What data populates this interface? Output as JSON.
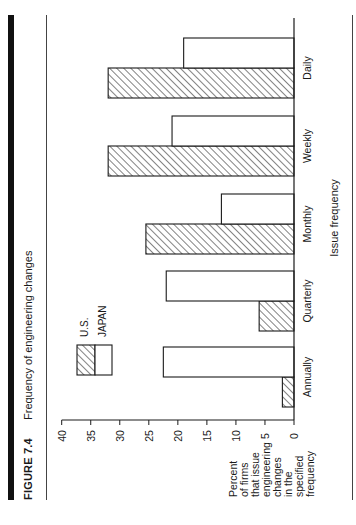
{
  "figure": {
    "label": "FIGURE 7.4",
    "title": "Frequency of engineering changes"
  },
  "colors": {
    "ink": "#1a1a1a",
    "background": "#ffffff",
    "rule": "#111111"
  },
  "chart_data": {
    "type": "bar",
    "orientation": "vertical (page printed rotated 90° counter-clockwise)",
    "title": "Frequency of engineering changes",
    "xlabel": "Issue frequency",
    "ylabel": "Percent of firms that issue engineering changes in the specified frequency",
    "ylabel_lines": [
      "Percent",
      "of firms",
      "that issue",
      "engineering",
      "changes",
      "in the",
      "specified",
      "frequency"
    ],
    "categories": [
      "Annually",
      "Quarterly",
      "Monthly",
      "Weekly",
      "Daily"
    ],
    "series": [
      {
        "name": "U.S.",
        "pattern": "hatched",
        "values": [
          2,
          6,
          25.5,
          32,
          32
        ]
      },
      {
        "name": "JAPAN",
        "pattern": "white",
        "values": [
          22.5,
          22,
          12.5,
          21,
          19
        ]
      }
    ],
    "ylim": [
      0,
      40
    ],
    "yticks": [
      0,
      5,
      10,
      15,
      20,
      25,
      30,
      35,
      40
    ],
    "grid": false,
    "legend": {
      "position": "upper-left inside plot",
      "entries": [
        "U.S.",
        "JAPAN"
      ]
    }
  }
}
